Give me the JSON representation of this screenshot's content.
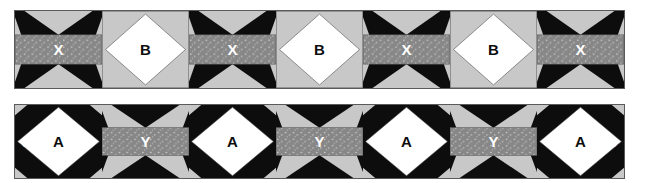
{
  "diagram": {
    "background_color": "#ffffff",
    "palette": {
      "black": "#0d0d0d",
      "light_gray": "#c8c8c8",
      "medium_gray_print": "#878787",
      "white": "#ffffff",
      "outline": "#5a5a5a"
    }
  },
  "rows": [
    {
      "name": "top-border-strip",
      "blocks": [
        {
          "label": "X",
          "style": "hourglass-print",
          "label_color": "light"
        },
        {
          "label": "B",
          "style": "square-in-square-white",
          "label_color": "dark"
        },
        {
          "label": "X",
          "style": "hourglass-print",
          "label_color": "light"
        },
        {
          "label": "B",
          "style": "square-in-square-white",
          "label_color": "dark"
        },
        {
          "label": "X",
          "style": "hourglass-print",
          "label_color": "light"
        },
        {
          "label": "B",
          "style": "square-in-square-white",
          "label_color": "dark"
        },
        {
          "label": "X",
          "style": "hourglass-print",
          "label_color": "light"
        }
      ],
      "edge_label_left": "",
      "edge_label_right": ""
    },
    {
      "name": "bottom-border-strip",
      "blocks": [
        {
          "label": "A",
          "style": "square-in-square-black",
          "label_color": "dark"
        },
        {
          "label": "Y",
          "style": "hourglass-print-inverse",
          "label_color": "light"
        },
        {
          "label": "A",
          "style": "square-in-square-black",
          "label_color": "dark"
        },
        {
          "label": "Y",
          "style": "hourglass-print-inverse",
          "label_color": "light"
        },
        {
          "label": "A",
          "style": "square-in-square-black",
          "label_color": "dark"
        },
        {
          "label": "Y",
          "style": "hourglass-print-inverse",
          "label_color": "light"
        },
        {
          "label": "A",
          "style": "square-in-square-black",
          "label_color": "dark"
        }
      ],
      "edge_label_left": "8",
      "edge_label_right": "8"
    }
  ]
}
